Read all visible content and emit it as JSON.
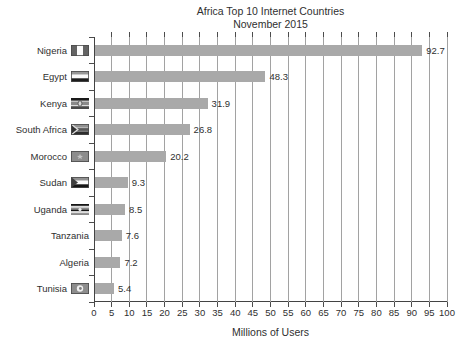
{
  "page": {
    "background": "#ffffff"
  },
  "chart_data": {
    "type": "bar",
    "orientation": "horizontal",
    "title": "Africa Top 10 Internet Countries",
    "subtitle": "November 2015",
    "xlabel": "Millions of Users",
    "xlim": [
      0,
      100
    ],
    "xticks": [
      0,
      5,
      10,
      15,
      20,
      25,
      30,
      35,
      40,
      45,
      50,
      55,
      60,
      65,
      70,
      75,
      80,
      85,
      90,
      95,
      100
    ],
    "grid": true,
    "legend": "none",
    "bar_color": "#a9a9a9",
    "grid_color": "#a2a2a2",
    "axis_color": "#434343",
    "text_color": "#2f2f2f",
    "rows": [
      {
        "label": "Nigeria",
        "value": 92.7,
        "value_label": "92.7",
        "flag": "nigeria-flag-icon"
      },
      {
        "label": "Egypt",
        "value": 48.3,
        "value_label": "48.3",
        "flag": "egypt-flag-icon"
      },
      {
        "label": "Kenya",
        "value": 31.9,
        "value_label": "31.9",
        "flag": "kenya-flag-icon"
      },
      {
        "label": "South Africa",
        "value": 26.8,
        "value_label": "26.8",
        "flag": "south-africa-flag-icon"
      },
      {
        "label": "Morocco",
        "value": 20.2,
        "value_label": "20.2",
        "flag": "morocco-flag-icon"
      },
      {
        "label": "Sudan",
        "value": 9.3,
        "value_label": "9.3",
        "flag": "sudan-flag-icon"
      },
      {
        "label": "Uganda",
        "value": 8.5,
        "value_label": "8.5",
        "flag": "uganda-flag-icon"
      },
      {
        "label": "Tanzania",
        "value": 7.6,
        "value_label": "7.6",
        "flag": null
      },
      {
        "label": "Algeria",
        "value": 7.2,
        "value_label": "7.2",
        "flag": null
      },
      {
        "label": "Tunisia",
        "value": 5.4,
        "value_label": "5.4",
        "flag": "tunisia-flag-icon"
      }
    ]
  }
}
